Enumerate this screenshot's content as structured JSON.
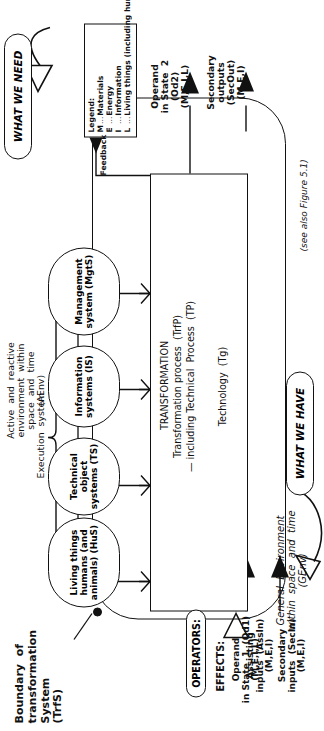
{
  "figure": {
    "caption": "(see also Figure 5.1)",
    "boundary_label": "Boundary  of\ntransformation\nSystem\n(TrfS)",
    "aenv_label": "Active  and  reactive\nenvironment  within\nspace  and  time\n(AEnv)",
    "genv_label": "General  Environment\nwithin  space  and  time\n(GEnv)",
    "execution_system_label": "Execution  system",
    "feedback_label": "Feedback"
  },
  "legend": {
    "title": "Legend:",
    "entries": [
      {
        "key": "M",
        "sep": "...",
        "value": "Materials"
      },
      {
        "key": "E",
        "sep": "...",
        "value": "Energy"
      },
      {
        "key": "I",
        "sep": "...",
        "value": "Information"
      },
      {
        "key": "L",
        "sep": "...",
        "value": "Living  things\n(including\nhumans)"
      }
    ]
  },
  "subsystems": [
    {
      "id": "mgts",
      "label": "Management\nsystem\n(MgtS)"
    },
    {
      "id": "is",
      "label": "Information\nsystems\n(IS)"
    },
    {
      "id": "ts",
      "label": "Technical\nobject\nsystems\n(TS)"
    },
    {
      "id": "hus",
      "label": "Living  things\nhumans\n(and animals)\n(HuS)"
    }
  ],
  "transformation_box": {
    "title": "TRANSFORMATION",
    "line2": "Transformation process  (TrfP)",
    "line3": "— including Technical  Process  (TP)",
    "technology": "Technology  (Tg)"
  },
  "inputs": {
    "operators_label": "OPERATORS:",
    "effects_label": "EFFECTS:",
    "items": [
      {
        "name": "operand-in-state-1",
        "label": "Operand\nin State  1  (Od1)\n(M,E,I,L)"
      },
      {
        "name": "assisting-inputs",
        "label": "Assisting\ninputs  (AssIn)\n(M,E,I)"
      },
      {
        "name": "secondary-inputs",
        "label": "Secondary\ninputs  (SecIn)\n(M,E,I)"
      }
    ],
    "bubble": "WHAT  WE  HAVE"
  },
  "outputs": {
    "items": [
      {
        "name": "operand-in-state-2",
        "label": "Operand\nin State  2\n(Od2)\n(M,E,I,L)"
      },
      {
        "name": "secondary-outputs",
        "label": "Secondary\noutputs\n(SecOut)\n(M,E,I)"
      }
    ],
    "bubble": "WHAT  WE  NEED"
  }
}
